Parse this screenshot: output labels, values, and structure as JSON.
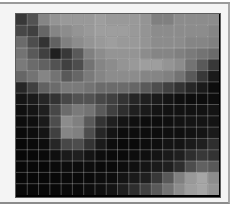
{
  "chart_data": {
    "type": "heatmap",
    "title": "",
    "xlabel": "",
    "ylabel": "",
    "colormap": "grayscale",
    "value_range": [
      0,
      1
    ],
    "rows": 16,
    "cols": 18,
    "grid": true,
    "values": [
      [
        0.22,
        0.32,
        0.52,
        0.58,
        0.6,
        0.6,
        0.6,
        0.62,
        0.6,
        0.6,
        0.6,
        0.58,
        0.5,
        0.5,
        0.55,
        0.55,
        0.55,
        0.55
      ],
      [
        0.28,
        0.25,
        0.4,
        0.52,
        0.55,
        0.58,
        0.6,
        0.62,
        0.62,
        0.62,
        0.6,
        0.58,
        0.55,
        0.55,
        0.55,
        0.55,
        0.55,
        0.52
      ],
      [
        0.42,
        0.3,
        0.2,
        0.38,
        0.5,
        0.55,
        0.58,
        0.6,
        0.62,
        0.6,
        0.6,
        0.58,
        0.55,
        0.55,
        0.55,
        0.52,
        0.52,
        0.5
      ],
      [
        0.45,
        0.35,
        0.25,
        0.12,
        0.22,
        0.35,
        0.5,
        0.55,
        0.58,
        0.58,
        0.58,
        0.55,
        0.52,
        0.52,
        0.5,
        0.48,
        0.45,
        0.42
      ],
      [
        0.48,
        0.42,
        0.38,
        0.32,
        0.25,
        0.3,
        0.45,
        0.52,
        0.55,
        0.58,
        0.6,
        0.62,
        0.62,
        0.58,
        0.55,
        0.45,
        0.35,
        0.22
      ],
      [
        0.4,
        0.45,
        0.52,
        0.45,
        0.35,
        0.4,
        0.48,
        0.52,
        0.55,
        0.55,
        0.55,
        0.52,
        0.52,
        0.5,
        0.45,
        0.35,
        0.22,
        0.1
      ],
      [
        0.15,
        0.25,
        0.38,
        0.42,
        0.48,
        0.48,
        0.45,
        0.42,
        0.42,
        0.42,
        0.4,
        0.35,
        0.3,
        0.25,
        0.2,
        0.15,
        0.1,
        0.05
      ],
      [
        0.08,
        0.1,
        0.15,
        0.2,
        0.28,
        0.32,
        0.32,
        0.28,
        0.25,
        0.2,
        0.15,
        0.12,
        0.1,
        0.08,
        0.06,
        0.05,
        0.05,
        0.05
      ],
      [
        0.06,
        0.08,
        0.12,
        0.28,
        0.42,
        0.48,
        0.45,
        0.35,
        0.25,
        0.18,
        0.12,
        0.1,
        0.08,
        0.07,
        0.07,
        0.07,
        0.07,
        0.08
      ],
      [
        0.05,
        0.06,
        0.1,
        0.3,
        0.55,
        0.5,
        0.35,
        0.2,
        0.12,
        0.08,
        0.06,
        0.05,
        0.05,
        0.06,
        0.07,
        0.08,
        0.08,
        0.08
      ],
      [
        0.04,
        0.05,
        0.08,
        0.25,
        0.52,
        0.5,
        0.3,
        0.15,
        0.08,
        0.05,
        0.05,
        0.05,
        0.05,
        0.06,
        0.06,
        0.07,
        0.08,
        0.1
      ],
      [
        0.03,
        0.04,
        0.05,
        0.15,
        0.28,
        0.3,
        0.2,
        0.1,
        0.05,
        0.04,
        0.04,
        0.05,
        0.06,
        0.08,
        0.08,
        0.1,
        0.12,
        0.18
      ],
      [
        0.03,
        0.03,
        0.04,
        0.06,
        0.1,
        0.12,
        0.08,
        0.05,
        0.04,
        0.04,
        0.05,
        0.06,
        0.08,
        0.1,
        0.12,
        0.18,
        0.22,
        0.2
      ],
      [
        0.03,
        0.03,
        0.03,
        0.04,
        0.05,
        0.05,
        0.05,
        0.04,
        0.04,
        0.05,
        0.06,
        0.08,
        0.1,
        0.12,
        0.18,
        0.3,
        0.38,
        0.35
      ],
      [
        0.03,
        0.03,
        0.03,
        0.03,
        0.04,
        0.04,
        0.04,
        0.05,
        0.05,
        0.08,
        0.1,
        0.12,
        0.22,
        0.35,
        0.5,
        0.6,
        0.65,
        0.55
      ],
      [
        0.03,
        0.03,
        0.03,
        0.03,
        0.04,
        0.04,
        0.05,
        0.06,
        0.08,
        0.12,
        0.18,
        0.25,
        0.35,
        0.45,
        0.55,
        0.62,
        0.65,
        0.58
      ]
    ]
  }
}
